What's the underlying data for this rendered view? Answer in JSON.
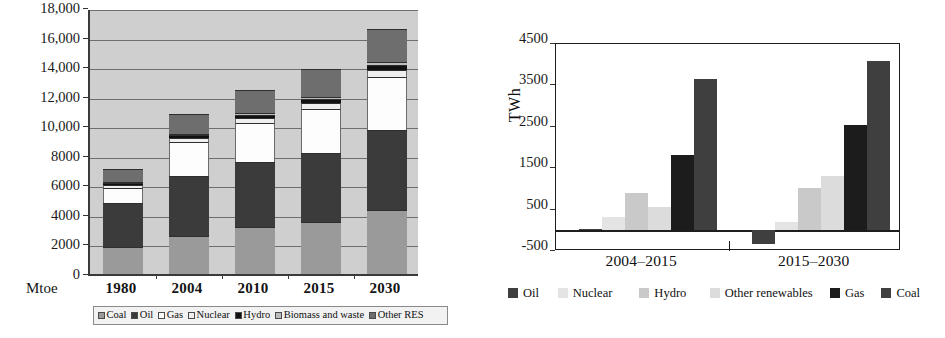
{
  "chart_data": [
    {
      "id": "world-primary-energy-demand",
      "type": "bar",
      "subtype": "stacked-vertical",
      "title": "",
      "xlabel": "",
      "ylabel": "Mtoe",
      "unit_label": "Mtoe",
      "ylim": [
        0,
        18000
      ],
      "ytick_step": 2000,
      "grid": true,
      "plot_background": "#cfcfcf",
      "legend_position": "bottom",
      "categories": [
        "1980",
        "2004",
        "2010",
        "2015",
        "2030"
      ],
      "ytick_labels": [
        "0",
        "2000",
        "4000",
        "6000",
        "8000",
        "10,000",
        "12,000",
        "14,000",
        "16,000",
        "18,000"
      ],
      "ytick_values": [
        0,
        2000,
        4000,
        6000,
        8000,
        10000,
        12000,
        14000,
        16000,
        18000
      ],
      "series": [
        {
          "name": "Coal",
          "color": "#9a9a9a",
          "values": [
            1800,
            2600,
            3150,
            3500,
            4350
          ]
        },
        {
          "name": "Oil",
          "color": "#3b3b3b",
          "values": [
            3000,
            4050,
            4400,
            4700,
            5400
          ]
        },
        {
          "name": "Gas",
          "color": "#fdfdfd",
          "values": [
            1050,
            2250,
            2650,
            2950,
            3600
          ]
        },
        {
          "name": "Nuclear",
          "color": "#efefef",
          "values": [
            160,
            300,
            350,
            400,
            450
          ]
        },
        {
          "name": "Hydro",
          "color": "#111111",
          "values": [
            150,
            200,
            230,
            280,
            340
          ]
        },
        {
          "name": "Biomass and waste",
          "color": "#bdbdbd",
          "values": [
            60,
            80,
            100,
            130,
            200
          ]
        },
        {
          "name": "Other RES",
          "color": "#6e6e6e",
          "values": [
            900,
            1350,
            1550,
            1900,
            2250
          ]
        }
      ]
    },
    {
      "id": "incremental-power-generation",
      "type": "bar",
      "subtype": "grouped-vertical",
      "title": "",
      "xlabel": "",
      "ylabel": "TWh",
      "ylim": [
        -500,
        4500
      ],
      "ytick_step": 1000,
      "grid": false,
      "plot_background": "#ffffff",
      "legend_position": "bottom",
      "categories": [
        "2004–2015",
        "2015–2030"
      ],
      "ytick_labels": [
        "-500",
        "500",
        "1500",
        "2500",
        "3500",
        "4500"
      ],
      "ytick_values": [
        -500,
        500,
        1500,
        2500,
        3500,
        4500
      ],
      "series": [
        {
          "name": "Oil",
          "color": "#3f3f3f",
          "values": [
            40,
            -330
          ]
        },
        {
          "name": "Nuclear",
          "color": "#e4e4e4",
          "values": [
            320,
            200
          ]
        },
        {
          "name": "Hydro",
          "color": "#c9c9c9",
          "values": [
            900,
            1020
          ]
        },
        {
          "name": "Other renewables",
          "color": "#dcdcdc",
          "values": [
            560,
            1300
          ]
        },
        {
          "name": "Gas",
          "color": "#1c1c1c",
          "values": [
            1830,
            2540
          ]
        },
        {
          "name": "Coal",
          "color": "#3f3f3f",
          "values": [
            3650,
            4100
          ]
        }
      ]
    }
  ]
}
